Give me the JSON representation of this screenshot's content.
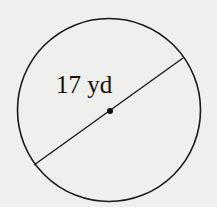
{
  "diagram": {
    "shape": "circle",
    "measurement_label": "17 yd",
    "measured_segment": "diameter",
    "center_point": true,
    "colors": {
      "background": "#efefed",
      "stroke": "#1a1a1a"
    }
  }
}
